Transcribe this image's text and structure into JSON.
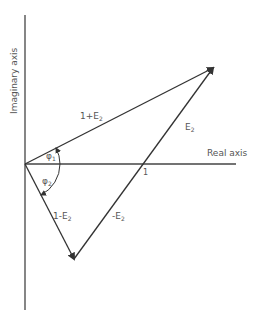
{
  "diagram": {
    "axes": {
      "imaginary_label": "Imaginary axis",
      "real_label": "Real axis",
      "unit_mark": "1"
    },
    "vectors": {
      "one_plus_e2": "1+E",
      "one_plus_e2_sub": "2",
      "e2": "E",
      "e2_sub": "2",
      "one_minus_e2": "1-E",
      "one_minus_e2_sub": "2",
      "minus_e2": "-E",
      "minus_e2_sub": "2"
    },
    "angles": {
      "phi1": "φ",
      "phi1_sub": "1",
      "phi2": "φ",
      "phi2_sub": "2"
    },
    "colors": {
      "line": "#333333",
      "text": "#555555"
    }
  }
}
